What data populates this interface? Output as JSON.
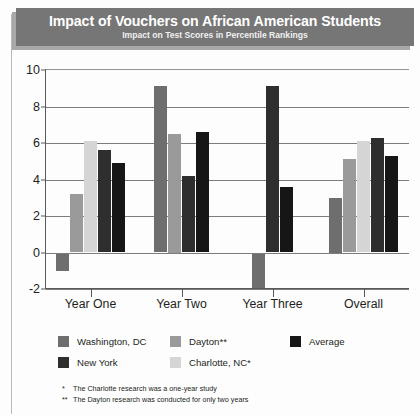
{
  "title": {
    "main": "Impact of Vouchers on African American Students",
    "sub": "Impact on Test Scores in Percentile Rankings",
    "banner_color": "#767676"
  },
  "footnotes": [
    {
      "mark": "*",
      "text": "The Charlotte research was a one-year study"
    },
    {
      "mark": "**",
      "text": "The Dayton research was conducted for only two years"
    }
  ],
  "legend": [
    {
      "label": "Washington, DC",
      "color": "#6e6e6e"
    },
    {
      "label": "Dayton**",
      "color": "#9a9a9a"
    },
    {
      "label": "Average",
      "color": "#161616"
    },
    {
      "label": "New York",
      "color": "#2e2e2e"
    },
    {
      "label": "Charlotte, NC*",
      "color": "#d5d5d5"
    }
  ],
  "chart_data": {
    "type": "bar",
    "title": "Impact of Vouchers on African American Students",
    "subtitle": "Impact on Test Scores in Percentile Rankings",
    "xlabel": "",
    "ylabel": "",
    "ylim": [
      -2,
      10
    ],
    "yticks": [
      -2,
      0,
      2,
      4,
      6,
      8,
      10
    ],
    "grid": true,
    "legend_position": "bottom",
    "categories": [
      "Year One",
      "Year Two",
      "Year Three",
      "Overall"
    ],
    "series": [
      {
        "name": "Washington, DC",
        "color": "#6e6e6e",
        "values": [
          -1.0,
          9.1,
          -2.0,
          3.0
        ]
      },
      {
        "name": "Dayton**",
        "color": "#9a9a9a",
        "values": [
          3.2,
          6.5,
          null,
          5.1
        ]
      },
      {
        "name": "Charlotte, NC*",
        "color": "#d5d5d5",
        "values": [
          6.1,
          null,
          null,
          6.1
        ]
      },
      {
        "name": "New York",
        "color": "#2e2e2e",
        "values": [
          5.6,
          4.2,
          9.1,
          6.3
        ]
      },
      {
        "name": "Average",
        "color": "#161616",
        "values": [
          4.9,
          6.6,
          3.6,
          5.3
        ]
      }
    ]
  }
}
